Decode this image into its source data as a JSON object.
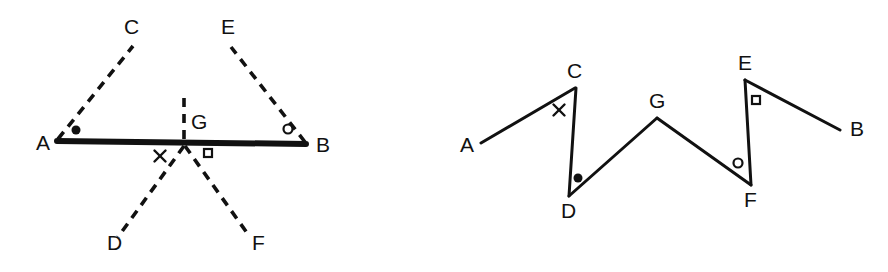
{
  "figure": {
    "background_color": "#ffffff",
    "stroke_color": "#111111",
    "panels": [
      {
        "id": "left-panel",
        "name": "straight-segment-with-rays",
        "labels": [
          {
            "id": "A",
            "text": "A",
            "x": 36,
            "y": 150
          },
          {
            "id": "B",
            "text": "B",
            "x": 316,
            "y": 152
          },
          {
            "id": "C",
            "text": "C",
            "x": 124,
            "y": 34
          },
          {
            "id": "D",
            "text": "D",
            "x": 107,
            "y": 250
          },
          {
            "id": "E",
            "text": "E",
            "x": 221,
            "y": 34
          },
          {
            "id": "F",
            "text": "F",
            "x": 252,
            "y": 250
          },
          {
            "id": "G",
            "text": "G",
            "x": 191,
            "y": 129
          }
        ],
        "solid_segments": [
          {
            "id": "AB",
            "from": "A",
            "to": "B",
            "x1": 57,
            "y1": 141,
            "x2": 306,
            "y2": 144,
            "width": 6
          }
        ],
        "dashed_segments": [
          {
            "id": "AC",
            "from": "A",
            "to": "C",
            "x1": 58,
            "y1": 139,
            "x2": 133,
            "y2": 46
          },
          {
            "id": "BE",
            "from": "B",
            "to": "E",
            "x1": 305,
            "y1": 142,
            "x2": 231,
            "y2": 47
          },
          {
            "id": "GD",
            "from": "G",
            "to": "D",
            "x1": 184,
            "y1": 146,
            "x2": 118,
            "y2": 237
          },
          {
            "id": "GF",
            "from": "G",
            "to": "F",
            "x1": 185,
            "y1": 146,
            "x2": 250,
            "y2": 237
          },
          {
            "id": "G-tick",
            "from": "G",
            "to": "tick-top",
            "x1": 184,
            "y1": 98,
            "x2": 184,
            "y2": 140
          }
        ],
        "markers": [
          {
            "id": "dot-A",
            "glyph": "filled-circle",
            "x": 76,
            "y": 130,
            "size": 9
          },
          {
            "id": "x-G-left",
            "glyph": "cross",
            "x": 160,
            "y": 156,
            "size": 11
          },
          {
            "id": "square-G-right",
            "glyph": "open-square",
            "x": 208,
            "y": 153,
            "size": 8
          },
          {
            "id": "circle-B",
            "glyph": "open-circle",
            "x": 288,
            "y": 129,
            "size": 9
          }
        ]
      },
      {
        "id": "right-panel",
        "name": "zigzag-path",
        "labels": [
          {
            "id": "A",
            "text": "A",
            "x": 460,
            "y": 152
          },
          {
            "id": "B",
            "text": "B",
            "x": 850,
            "y": 136
          },
          {
            "id": "C",
            "text": "C",
            "x": 567,
            "y": 78
          },
          {
            "id": "D",
            "text": "D",
            "x": 561,
            "y": 218
          },
          {
            "id": "E",
            "text": "E",
            "x": 738,
            "y": 70
          },
          {
            "id": "F",
            "text": "F",
            "x": 744,
            "y": 207
          },
          {
            "id": "G",
            "text": "G",
            "x": 649,
            "y": 108
          }
        ],
        "solid_segments": [
          {
            "id": "AC",
            "from": "A",
            "to": "C",
            "x1": 481,
            "y1": 143,
            "x2": 575,
            "y2": 88,
            "width": 3
          },
          {
            "id": "CD",
            "from": "C",
            "to": "D",
            "x1": 576,
            "y1": 88,
            "x2": 569,
            "y2": 196,
            "width": 3
          },
          {
            "id": "DG",
            "from": "D",
            "to": "G",
            "x1": 569,
            "y1": 196,
            "x2": 657,
            "y2": 118,
            "width": 3
          },
          {
            "id": "GF",
            "from": "G",
            "to": "F",
            "x1": 657,
            "y1": 118,
            "x2": 751,
            "y2": 185,
            "width": 3
          },
          {
            "id": "FE",
            "from": "F",
            "to": "E",
            "x1": 751,
            "y1": 185,
            "x2": 745,
            "y2": 80,
            "width": 3
          },
          {
            "id": "EB",
            "from": "E",
            "to": "B",
            "x1": 745,
            "y1": 80,
            "x2": 840,
            "y2": 130,
            "width": 3
          }
        ],
        "dashed_segments": [],
        "markers": [
          {
            "id": "x-C",
            "glyph": "cross",
            "x": 559,
            "y": 110,
            "size": 11
          },
          {
            "id": "dot-D",
            "glyph": "filled-circle",
            "x": 578,
            "y": 178,
            "size": 9
          },
          {
            "id": "circle-F",
            "glyph": "open-circle",
            "x": 738,
            "y": 163,
            "size": 9
          },
          {
            "id": "square-E",
            "glyph": "open-square",
            "x": 756,
            "y": 100,
            "size": 8
          }
        ]
      }
    ]
  }
}
